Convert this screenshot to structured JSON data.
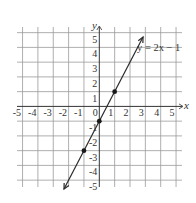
{
  "chart_data": {
    "type": "line",
    "title": "",
    "xlabel": "x",
    "ylabel": "y",
    "xlim": [
      -5,
      5
    ],
    "ylim": [
      -5,
      5
    ],
    "grid": true,
    "x_ticks": [
      -5,
      -4,
      -3,
      -2,
      -1,
      0,
      1,
      2,
      3,
      4,
      5
    ],
    "y_ticks": [
      -5,
      -4,
      -3,
      -2,
      -1,
      1,
      2,
      3,
      4,
      5
    ],
    "x_tick_labels": [
      "-5",
      "-4",
      "-3",
      "-2",
      "-1",
      "0",
      "1",
      "2",
      "3",
      "4",
      "5"
    ],
    "y_tick_labels": [
      "-5",
      "-4",
      "-3",
      "-2",
      "-1",
      "1",
      "2",
      "3",
      "4",
      "5"
    ],
    "series": [
      {
        "name": "y = 2x − 1",
        "equation": "y = 2x - 1",
        "slope": 2,
        "intercept": -1,
        "x_range": [
          -2.3,
          2.85
        ],
        "arrows": "both",
        "points": [
          {
            "x": -1,
            "y": -3
          },
          {
            "x": 0,
            "y": -1
          },
          {
            "x": 1,
            "y": 1
          }
        ]
      }
    ],
    "annotations": [
      {
        "text": "y = 2x − 1",
        "x": 2.6,
        "y": 3.7
      }
    ]
  },
  "labels": {
    "x_axis": "x",
    "y_axis": "y",
    "equation": "y = 2x − 1"
  }
}
